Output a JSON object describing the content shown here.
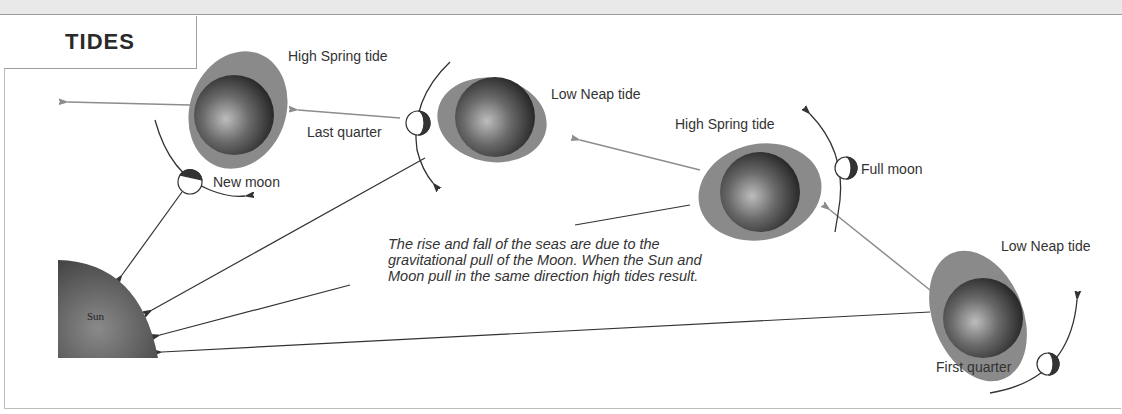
{
  "title": "TIDES",
  "labels": {
    "high_spring_1": "High Spring tide",
    "low_neap_1": "Low Neap tide",
    "high_spring_2": "High Spring tide",
    "low_neap_2": "Low Neap tide",
    "new_moon": "New moon",
    "last_quarter": "Last quarter",
    "full_moon": "Full moon",
    "first_quarter": "First quarter",
    "sun": "Sun"
  },
  "caption": "The rise and fall of the seas are due to the gravitational pull of the Moon. When the Sun and Moon pull in the same direction high tides result.",
  "colors": {
    "tide_bulge": "#888888",
    "earth_dark": "#2b2b2b",
    "sun": "#555555",
    "orbit_arrow": "#8c8c8c",
    "pull_line": "#333333"
  }
}
